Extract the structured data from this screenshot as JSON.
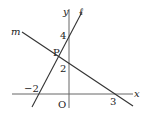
{
  "diagram": {
    "type": "coordinate-plane",
    "axes": {
      "x_label": "x",
      "y_label": "y",
      "origin_label": "O"
    },
    "lines": [
      {
        "name": "ℓ",
        "label": "ℓ",
        "points": [
          [
            -2,
            0
          ],
          [
            0,
            4
          ]
        ],
        "x_intercept": -2,
        "y_intercept": 4
      },
      {
        "name": "m",
        "label": "m",
        "points": [
          [
            0,
            2
          ],
          [
            3,
            0
          ]
        ],
        "x_intercept": 3,
        "y_intercept": 2
      }
    ],
    "intersection": {
      "label": "P"
    },
    "tick_labels": {
      "x_neg2": "−2",
      "x_3": "3",
      "y_4": "4",
      "y_2": "2"
    },
    "colors": {
      "line": "#333333",
      "axis": "#666666",
      "text": "#222222"
    }
  }
}
